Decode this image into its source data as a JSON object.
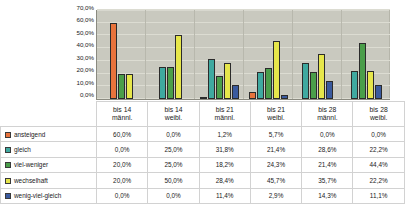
{
  "chart_data": {
    "type": "bar",
    "title": "",
    "xlabel": "",
    "ylabel": "",
    "ylim": [
      0,
      70
    ],
    "grid": true,
    "legend_position": "bottom-table",
    "categories": [
      "bis 14 männl.",
      "bis 14 weibl.",
      "bis 21 männl.",
      "bis 21 weibl.",
      "bis 28 männl.",
      "bis 28 weibl."
    ],
    "category_lines": [
      [
        "bis 14",
        "männl."
      ],
      [
        "bis 14",
        "weibl."
      ],
      [
        "bis 21",
        "männl."
      ],
      [
        "bis 21",
        "weibl."
      ],
      [
        "bis 28",
        "männl."
      ],
      [
        "bis 28",
        "weibl."
      ]
    ],
    "yticks": [
      "70,0%",
      "60,0%",
      "50,0%",
      "40,0%",
      "30,0%",
      "20,0%",
      "10,0%",
      "0,0%"
    ],
    "ytick_values": [
      70,
      60,
      50,
      40,
      30,
      20,
      10,
      0
    ],
    "series": [
      {
        "name": "ansteigend",
        "color": "#e8733c",
        "values": [
          60.0,
          0.0,
          1.2,
          5.7,
          0.0,
          0.0
        ],
        "labels": [
          "60,0%",
          "0,0%",
          "1,2%",
          "5,7%",
          "0,0%",
          "0,0%"
        ]
      },
      {
        "name": "gleich",
        "color": "#3fa9a0",
        "values": [
          0.0,
          25.0,
          31.8,
          21.4,
          28.6,
          22.2
        ],
        "labels": [
          "0,0%",
          "25,0%",
          "31,8%",
          "21,4%",
          "28,6%",
          "22,2%"
        ]
      },
      {
        "name": "viel-weniger",
        "color": "#4a9e4a",
        "values": [
          20.0,
          25.0,
          18.2,
          24.3,
          21.4,
          44.4
        ],
        "labels": [
          "20,0%",
          "25,0%",
          "18,2%",
          "24,3%",
          "21,4%",
          "44,4%"
        ]
      },
      {
        "name": "wechselhaft",
        "color": "#e6e64b",
        "values": [
          20.0,
          50.0,
          28.4,
          45.7,
          35.7,
          22.2
        ],
        "labels": [
          "20,0%",
          "50,0%",
          "28,4%",
          "45,7%",
          "35,7%",
          "22,2%"
        ]
      },
      {
        "name": "wenig-viel-gleich",
        "color": "#3a5a9e",
        "values": [
          0.0,
          0.0,
          11.4,
          2.9,
          14.3,
          11.1
        ],
        "labels": [
          "0,0%",
          "0,0%",
          "11,4%",
          "2,9%",
          "14,3%",
          "11,1%"
        ]
      }
    ]
  }
}
